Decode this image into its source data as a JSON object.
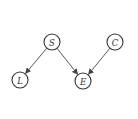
{
  "diagram": {
    "type": "directed-graph",
    "nodes": [
      {
        "id": "S",
        "label": "S",
        "x": 52,
        "y": 42,
        "r": 8
      },
      {
        "id": "C",
        "label": "C",
        "x": 115,
        "y": 42,
        "r": 8
      },
      {
        "id": "L",
        "label": "L",
        "x": 20,
        "y": 80,
        "r": 8
      },
      {
        "id": "E",
        "label": "E",
        "x": 83,
        "y": 81,
        "r": 8
      }
    ],
    "edges": [
      {
        "from": "S",
        "to": "L"
      },
      {
        "from": "S",
        "to": "E"
      },
      {
        "from": "C",
        "to": "E"
      }
    ],
    "colors": {
      "stroke": "#333333",
      "background": "#ffffff"
    }
  }
}
